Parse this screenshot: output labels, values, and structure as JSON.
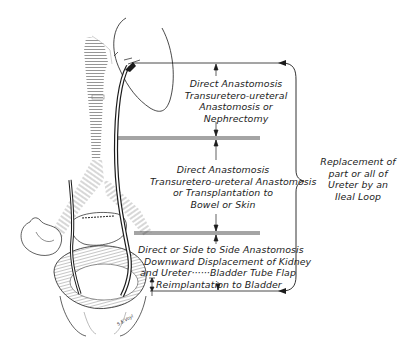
{
  "figure": {
    "type": "anatomical-diagram",
    "segments": [
      {
        "id": "upper",
        "lines": [
          "Direct Anastomosis",
          "Transuretero-ureteral",
          "Anastomosis or",
          "Nephrectomy"
        ]
      },
      {
        "id": "middle",
        "lines": [
          "Direct Anastomosis",
          "Transuretero-ureteral Anastomosis",
          "or Transplantation to",
          "Bowel or Skin"
        ]
      },
      {
        "id": "lower",
        "lines": [
          "Direct or Side to Side Anastomosis",
          "Downward Displacement of Kidney",
          "and Ureter······Bladder Tube Flap",
          "Reimplantation to Bladder"
        ]
      }
    ],
    "brace_label": {
      "lines": [
        "Replacement of",
        "part or all of",
        "Ureter by an",
        "Ileal Loop"
      ]
    },
    "signature": "S.E.Voyl",
    "colors": {
      "ink": "#1c1c1c",
      "hatch": "#8a8a8a",
      "background": "#ffffff"
    }
  }
}
